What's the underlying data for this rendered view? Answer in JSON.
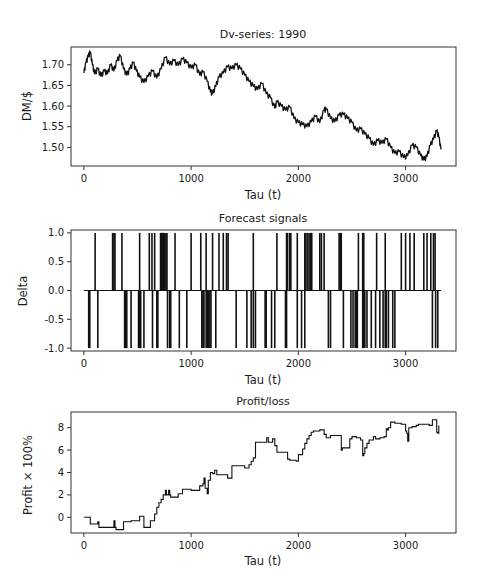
{
  "chart_data": [
    {
      "type": "line",
      "title": "Dv-series: 1990",
      "xlabel": "Tau (t)",
      "ylabel": "DM/$",
      "xlim": [
        -120,
        3470
      ],
      "ylim": [
        1.455,
        1.743
      ],
      "xticks": [
        0,
        1000,
        2000,
        3000
      ],
      "xtick_labels": [
        "0",
        "1000",
        "2000",
        "3000"
      ],
      "yticks": [
        1.5,
        1.55,
        1.6,
        1.65,
        1.7
      ],
      "ytick_labels": [
        "1.50",
        "1.55",
        "1.60",
        "1.65",
        "1.70"
      ],
      "grid": false,
      "legend": null,
      "series": [
        {
          "name": "DM/$",
          "x": [
            0,
            20,
            40,
            60,
            80,
            100,
            130,
            160,
            190,
            220,
            250,
            280,
            310,
            340,
            370,
            400,
            430,
            460,
            490,
            520,
            560,
            600,
            640,
            680,
            720,
            760,
            800,
            840,
            880,
            920,
            960,
            1000,
            1040,
            1080,
            1110,
            1150,
            1180,
            1200,
            1230,
            1260,
            1300,
            1340,
            1380,
            1420,
            1460,
            1500,
            1540,
            1580,
            1620,
            1660,
            1700,
            1740,
            1780,
            1800,
            1840,
            1880,
            1920,
            1960,
            2000,
            2040,
            2080,
            2120,
            2160,
            2200,
            2240,
            2260,
            2300,
            2340,
            2380,
            2420,
            2460,
            2500,
            2540,
            2580,
            2620,
            2660,
            2700,
            2740,
            2780,
            2820,
            2860,
            2900,
            2940,
            2980,
            3020,
            3060,
            3100,
            3140,
            3170,
            3200,
            3230,
            3260,
            3290,
            3310,
            3330
          ],
          "values": [
            1.68,
            1.705,
            1.72,
            1.73,
            1.7,
            1.678,
            1.69,
            1.672,
            1.685,
            1.678,
            1.7,
            1.685,
            1.71,
            1.722,
            1.69,
            1.675,
            1.69,
            1.705,
            1.685,
            1.67,
            1.657,
            1.672,
            1.685,
            1.668,
            1.69,
            1.718,
            1.7,
            1.71,
            1.698,
            1.714,
            1.705,
            1.692,
            1.7,
            1.675,
            1.683,
            1.66,
            1.635,
            1.63,
            1.648,
            1.67,
            1.68,
            1.695,
            1.69,
            1.7,
            1.69,
            1.675,
            1.66,
            1.648,
            1.64,
            1.655,
            1.63,
            1.62,
            1.595,
            1.61,
            1.6,
            1.59,
            1.598,
            1.57,
            1.56,
            1.555,
            1.55,
            1.562,
            1.575,
            1.56,
            1.59,
            1.592,
            1.57,
            1.562,
            1.578,
            1.58,
            1.57,
            1.56,
            1.54,
            1.545,
            1.532,
            1.522,
            1.505,
            1.517,
            1.51,
            1.52,
            1.5,
            1.485,
            1.49,
            1.475,
            1.48,
            1.505,
            1.5,
            1.48,
            1.47,
            1.478,
            1.505,
            1.52,
            1.54,
            1.525,
            1.495
          ]
        }
      ]
    },
    {
      "type": "bar",
      "title": "Forecast signals",
      "xlabel": "Tau (t)",
      "ylabel": "Delta",
      "xlim": [
        -120,
        3470
      ],
      "ylim": [
        -1.05,
        1.05
      ],
      "xticks": [
        0,
        1000,
        2000,
        3000
      ],
      "xtick_labels": [
        "0",
        "1000",
        "2000",
        "3000"
      ],
      "yticks": [
        -1.0,
        -0.5,
        0.0,
        0.5,
        1.0
      ],
      "ytick_labels": [
        "-1.0",
        "-0.5",
        "0.0",
        "0.5",
        "1.0"
      ],
      "grid": false,
      "legend": null,
      "baseline_range": [
        0,
        3330
      ],
      "series": [
        {
          "name": "buy (+1)",
          "tau": [
            105,
            268,
            280,
            290,
            355,
            520,
            610,
            635,
            660,
            715,
            725,
            735,
            745,
            755,
            765,
            775,
            850,
            1000,
            1090,
            1140,
            1200,
            1260,
            1300,
            1330,
            1345,
            1580,
            1800,
            1890,
            1900,
            1920,
            1930,
            1990,
            2060,
            2070,
            2085,
            2100,
            2115,
            2125,
            2200,
            2215,
            2240,
            2380,
            2390,
            2400,
            2560,
            2600,
            2610,
            2730,
            2810,
            2960,
            3000,
            3040,
            3080,
            3170,
            3200,
            3235,
            3260,
            3275
          ],
          "values": 1
        },
        {
          "name": "sell (-1)",
          "tau": [
            45,
            55,
            130,
            380,
            390,
            400,
            440,
            510,
            520,
            530,
            560,
            640,
            680,
            690,
            780,
            800,
            810,
            890,
            960,
            1100,
            1110,
            1120,
            1140,
            1150,
            1160,
            1175,
            1185,
            1230,
            1420,
            1520,
            1560,
            1580,
            1600,
            1690,
            1700,
            1750,
            1780,
            1880,
            1890,
            1990,
            2030,
            2060,
            2280,
            2300,
            2420,
            2490,
            2510,
            2530,
            2540,
            2550,
            2600,
            2610,
            2620,
            2640,
            2680,
            2720,
            2760,
            2790,
            2810,
            2820,
            2840,
            2880,
            2900,
            3250,
            3280,
            3300
          ],
          "values": -1
        }
      ]
    },
    {
      "type": "line",
      "title": "Profit/loss",
      "xlabel": "Tau (t)",
      "ylabel": "Profit × 100%",
      "xlim": [
        -120,
        3470
      ],
      "ylim": [
        -1.4,
        9.4
      ],
      "xticks": [
        0,
        1000,
        2000,
        3000
      ],
      "xtick_labels": [
        "0",
        "1000",
        "2000",
        "3000"
      ],
      "yticks": [
        0,
        2,
        4,
        6,
        8
      ],
      "ytick_labels": [
        "0",
        "2",
        "4",
        "6",
        "8"
      ],
      "grid": false,
      "legend": null,
      "series": [
        {
          "name": "Profit/loss",
          "step": true,
          "x": [
            0,
            50,
            60,
            110,
            130,
            140,
            260,
            280,
            290,
            300,
            360,
            370,
            440,
            520,
            530,
            560,
            580,
            620,
            640,
            660,
            680,
            700,
            720,
            740,
            760,
            770,
            790,
            800,
            810,
            840,
            880,
            920,
            960,
            1000,
            1080,
            1100,
            1110,
            1120,
            1130,
            1150,
            1160,
            1180,
            1200,
            1220,
            1240,
            1280,
            1340,
            1380,
            1400,
            1500,
            1540,
            1560,
            1580,
            1600,
            1700,
            1705,
            1720,
            1760,
            1780,
            1800,
            1880,
            1900,
            1920,
            1980,
            2000,
            2040,
            2060,
            2080,
            2100,
            2120,
            2140,
            2200,
            2240,
            2260,
            2300,
            2380,
            2400,
            2410,
            2420,
            2480,
            2500,
            2540,
            2580,
            2600,
            2610,
            2620,
            2640,
            2660,
            2700,
            2720,
            2760,
            2800,
            2820,
            2830,
            2840,
            2860,
            2900,
            2960,
            3000,
            3010,
            3020,
            3030,
            3040,
            3060,
            3100,
            3120,
            3200,
            3220,
            3250,
            3270,
            3290,
            3300,
            3310
          ],
          "values": [
            0.0,
            0.0,
            -0.6,
            -0.6,
            -0.4,
            -0.9,
            -0.9,
            -0.3,
            -0.9,
            -1.1,
            -1.1,
            -0.4,
            -0.3,
            0.1,
            0.1,
            -0.9,
            -0.9,
            -0.3,
            -0.3,
            0.3,
            0.9,
            1.3,
            1.6,
            2.0,
            2.4,
            2.0,
            2.4,
            2.0,
            1.8,
            1.8,
            2.1,
            2.5,
            2.5,
            2.4,
            2.8,
            2.8,
            3.0,
            3.5,
            2.6,
            2.1,
            3.3,
            4.0,
            3.9,
            4.2,
            3.8,
            3.8,
            3.5,
            4.6,
            4.6,
            4.4,
            4.7,
            5.0,
            5.3,
            6.7,
            6.7,
            7.1,
            6.7,
            7.0,
            6.4,
            5.8,
            5.8,
            5.2,
            5.1,
            5.0,
            5.6,
            6.1,
            6.6,
            7.0,
            7.3,
            7.6,
            7.7,
            7.8,
            7.4,
            7.1,
            7.3,
            7.3,
            6.0,
            6.2,
            6.2,
            7.0,
            7.2,
            7.1,
            6.9,
            5.5,
            5.7,
            6.2,
            6.6,
            6.9,
            7.2,
            7.0,
            7.1,
            7.2,
            7.9,
            7.8,
            8.0,
            8.5,
            8.4,
            8.3,
            7.7,
            7.5,
            6.8,
            8.0,
            8.0,
            8.1,
            8.2,
            8.3,
            8.3,
            8.2,
            8.7,
            8.7,
            7.6,
            7.5,
            8.2,
            9.0,
            9.1
          ]
        }
      ]
    }
  ]
}
